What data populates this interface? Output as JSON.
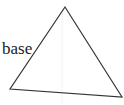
{
  "diagram": {
    "shape": "triangle",
    "side_label": "base",
    "vertices": {
      "top": [
        65,
        7
      ],
      "bottom_left": [
        10,
        89
      ],
      "bottom_right": [
        122,
        97
      ]
    },
    "stroke_color": "#333333",
    "background": "#ffffff"
  }
}
